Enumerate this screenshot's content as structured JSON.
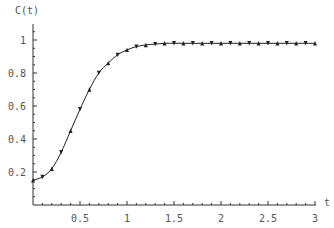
{
  "chart_data": {
    "type": "line",
    "title": "",
    "xlabel": "t",
    "ylabel": "C(t)",
    "xlim": [
      0,
      3
    ],
    "ylim": [
      0,
      1.05
    ],
    "grid": false,
    "legend": null,
    "x_ticks": [
      0.5,
      1,
      1.5,
      2,
      2.5,
      3
    ],
    "x_tick_labels": [
      "0.5",
      "1",
      "1.5",
      "2",
      "2.5",
      "3"
    ],
    "y_ticks": [
      0.2,
      0.4,
      0.6,
      0.8,
      1
    ],
    "y_tick_labels": [
      "0.2",
      "0.4",
      "0.6",
      "0.8",
      "1"
    ],
    "series": [
      {
        "name": "C(t)",
        "style": "line with triangle markers",
        "color": "#222222",
        "x": [
          0,
          0.1,
          0.2,
          0.3,
          0.4,
          0.5,
          0.6,
          0.7,
          0.8,
          0.9,
          1.0,
          1.1,
          1.2,
          1.3,
          1.4,
          1.5,
          1.6,
          1.7,
          1.8,
          1.9,
          2.0,
          2.1,
          2.2,
          2.3,
          2.4,
          2.5,
          2.6,
          2.7,
          2.8,
          2.9,
          3.0
        ],
        "values": [
          0.15,
          0.17,
          0.22,
          0.32,
          0.45,
          0.58,
          0.7,
          0.8,
          0.86,
          0.91,
          0.94,
          0.96,
          0.97,
          0.975,
          0.98,
          0.98,
          0.98,
          0.98,
          0.98,
          0.98,
          0.98,
          0.98,
          0.98,
          0.98,
          0.98,
          0.98,
          0.98,
          0.98,
          0.98,
          0.98,
          0.98
        ]
      }
    ]
  }
}
